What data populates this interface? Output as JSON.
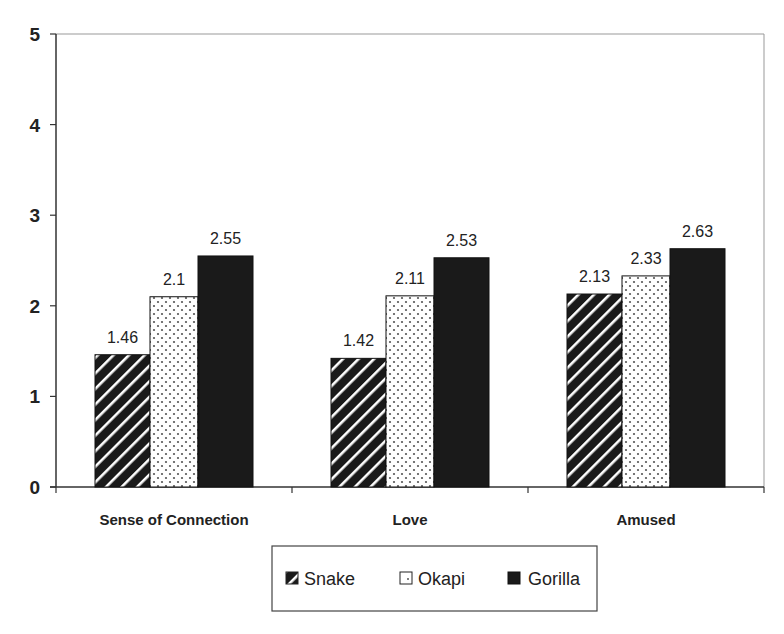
{
  "chart_data": {
    "type": "bar",
    "title": "",
    "xlabel": "",
    "ylabel": "",
    "ylim": [
      0,
      5
    ],
    "yticks": [
      0,
      1,
      2,
      3,
      4,
      5
    ],
    "categories": [
      "Sense of Connection",
      "Love",
      "Amused"
    ],
    "series": [
      {
        "name": "Snake",
        "pattern": "diagonal-hatch",
        "values": [
          1.46,
          1.42,
          2.13
        ]
      },
      {
        "name": "Okapi",
        "pattern": "dotted",
        "values": [
          2.1,
          2.11,
          2.33
        ]
      },
      {
        "name": "Gorilla",
        "pattern": "solid-black",
        "values": [
          2.55,
          2.53,
          2.63
        ]
      }
    ],
    "value_labels": [
      [
        "1.46",
        "2.1",
        "2.55"
      ],
      [
        "1.42",
        "2.11",
        "2.53"
      ],
      [
        "2.13",
        "2.33",
        "2.63"
      ]
    ],
    "grid": false,
    "legend_position": "bottom-center"
  },
  "legend": {
    "items": [
      {
        "label": "Snake",
        "icon": "hatched-square-icon"
      },
      {
        "label": "Okapi",
        "icon": "dotted-square-icon"
      },
      {
        "label": "Gorilla",
        "icon": "black-square-icon"
      }
    ]
  },
  "colors": {
    "bar_dark": "#1a1a1a",
    "bar_stripe": "#ffffff",
    "dot": "#555555",
    "axis": "#333333",
    "frame": "#999999"
  }
}
